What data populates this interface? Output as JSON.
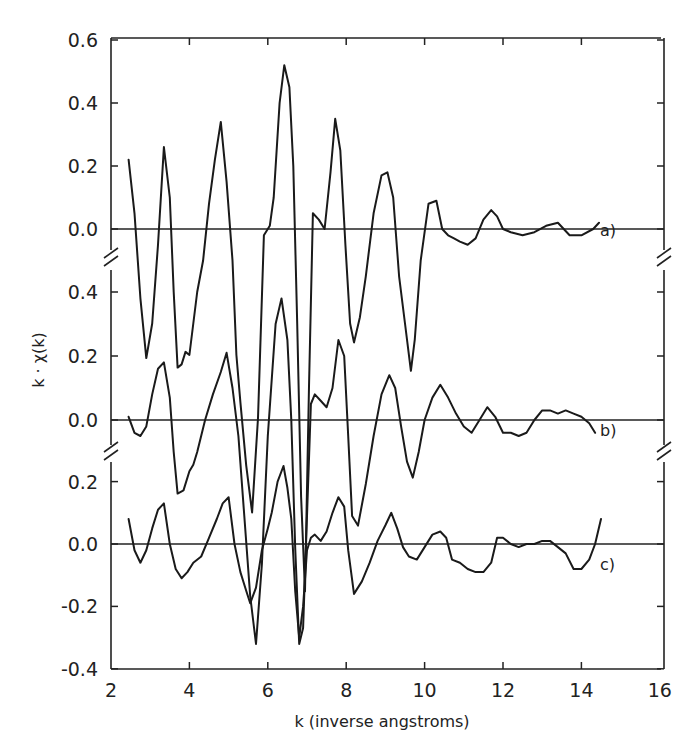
{
  "chart_data": {
    "type": "line",
    "title": "",
    "xlabel": "k (inverse angstroms)",
    "ylabel": "k · χ(k)",
    "xlim": [
      2,
      16
    ],
    "x_ticks": [
      "2",
      "4",
      "6",
      "8",
      "10",
      "12",
      "14",
      "16"
    ],
    "grid": false,
    "legend": null,
    "layout": "three vertically offset panels sharing one frame, separated by axis break marks",
    "panels": [
      {
        "name": "a)",
        "y_ticks": [
          "0.6",
          "0.4",
          "0.2",
          "0.0"
        ],
        "ylim": [
          -0.45,
          0.6
        ],
        "series": {
          "name": "a)",
          "x": [
            2.45,
            2.6,
            2.75,
            2.9,
            3.05,
            3.2,
            3.35,
            3.5,
            3.6,
            3.7,
            3.8,
            3.9,
            4.0,
            4.1,
            4.2,
            4.35,
            4.5,
            4.65,
            4.8,
            4.95,
            5.1,
            5.2,
            5.3,
            5.45,
            5.6,
            5.75,
            5.9,
            6.05,
            6.15,
            6.3,
            6.42,
            6.55,
            6.65,
            6.75,
            6.85,
            6.95,
            7.05,
            7.15,
            7.3,
            7.45,
            7.6,
            7.72,
            7.85,
            7.98,
            8.1,
            8.2,
            8.35,
            8.5,
            8.7,
            8.9,
            9.05,
            9.2,
            9.35,
            9.5,
            9.65,
            9.75,
            9.9,
            10.1,
            10.3,
            10.45,
            10.6,
            10.75,
            10.9,
            11.1,
            11.3,
            11.5,
            11.7,
            11.85,
            12.0,
            12.2,
            12.5,
            12.8,
            13.1,
            13.4,
            13.7,
            14.0,
            14.3,
            14.45
          ],
          "values": [
            0.22,
            0.05,
            -0.22,
            -0.41,
            -0.3,
            -0.05,
            0.26,
            0.1,
            -0.2,
            -0.44,
            -0.43,
            -0.39,
            -0.4,
            -0.3,
            -0.2,
            -0.1,
            0.08,
            0.22,
            0.34,
            0.15,
            -0.1,
            -0.4,
            -0.55,
            -0.75,
            -0.9,
            -0.6,
            -0.02,
            0.01,
            0.1,
            0.4,
            0.52,
            0.45,
            0.2,
            -0.3,
            -0.85,
            -1.15,
            -0.5,
            0.05,
            0.03,
            0.0,
            0.18,
            0.35,
            0.25,
            -0.05,
            -0.3,
            -0.36,
            -0.28,
            -0.15,
            0.05,
            0.17,
            0.18,
            0.1,
            -0.15,
            -0.3,
            -0.45,
            -0.35,
            -0.1,
            0.08,
            0.09,
            0.0,
            -0.02,
            -0.03,
            -0.04,
            -0.05,
            -0.03,
            0.03,
            0.06,
            0.04,
            0.0,
            -0.01,
            -0.02,
            -0.01,
            0.01,
            0.02,
            -0.02,
            -0.02,
            0.0,
            0.02
          ]
        }
      },
      {
        "name": "b)",
        "y_ticks": [
          "0.4",
          "0.2",
          "0.0"
        ],
        "ylim": [
          -0.1,
          0.45
        ],
        "series": {
          "name": "b)",
          "x": [
            2.45,
            2.6,
            2.75,
            2.9,
            3.05,
            3.2,
            3.35,
            3.5,
            3.6,
            3.7,
            3.85,
            4.0,
            4.1,
            4.2,
            4.4,
            4.6,
            4.8,
            4.95,
            5.1,
            5.25,
            5.4,
            5.55,
            5.7,
            5.85,
            6.0,
            6.2,
            6.35,
            6.5,
            6.6,
            6.7,
            6.8,
            6.9,
            7.0,
            7.1,
            7.2,
            7.35,
            7.5,
            7.65,
            7.8,
            7.95,
            8.05,
            8.15,
            8.3,
            8.5,
            8.7,
            8.9,
            9.1,
            9.25,
            9.4,
            9.55,
            9.7,
            9.85,
            10.0,
            10.2,
            10.4,
            10.6,
            10.8,
            11.0,
            11.2,
            11.4,
            11.6,
            11.8,
            12.0,
            12.2,
            12.4,
            12.6,
            12.8,
            13.0,
            13.2,
            13.4,
            13.6,
            13.8,
            14.0,
            14.2,
            14.35
          ],
          "values": [
            0.01,
            -0.04,
            -0.05,
            -0.02,
            0.08,
            0.16,
            0.18,
            0.07,
            -0.1,
            -0.23,
            -0.22,
            -0.16,
            -0.14,
            -0.1,
            0.0,
            0.08,
            0.15,
            0.21,
            0.1,
            -0.05,
            -0.3,
            -0.55,
            -0.7,
            -0.45,
            -0.05,
            0.3,
            0.38,
            0.25,
            0.0,
            -0.4,
            -0.7,
            -0.65,
            -0.3,
            0.05,
            0.08,
            0.06,
            0.04,
            0.1,
            0.25,
            0.2,
            -0.05,
            -0.3,
            -0.33,
            -0.2,
            -0.05,
            0.08,
            0.14,
            0.1,
            -0.02,
            -0.13,
            -0.18,
            -0.1,
            0.0,
            0.07,
            0.11,
            0.07,
            0.02,
            -0.02,
            -0.04,
            0.0,
            0.04,
            0.01,
            -0.04,
            -0.04,
            -0.05,
            -0.04,
            0.0,
            0.03,
            0.03,
            0.02,
            0.03,
            0.02,
            0.01,
            -0.01,
            -0.04
          ]
        }
      },
      {
        "name": "c)",
        "y_ticks": [
          "0.2",
          "0.0",
          "-0.2",
          "-0.4"
        ],
        "ylim": [
          -0.4,
          0.25
        ],
        "series": {
          "name": "c)",
          "x": [
            2.45,
            2.6,
            2.75,
            2.9,
            3.05,
            3.2,
            3.35,
            3.5,
            3.65,
            3.8,
            3.95,
            4.1,
            4.3,
            4.5,
            4.7,
            4.85,
            5.0,
            5.15,
            5.3,
            5.45,
            5.55,
            5.7,
            5.85,
            6.0,
            6.1,
            6.25,
            6.4,
            6.5,
            6.6,
            6.7,
            6.8,
            6.9,
            7.0,
            7.1,
            7.2,
            7.35,
            7.5,
            7.65,
            7.8,
            7.95,
            8.05,
            8.2,
            8.4,
            8.6,
            8.8,
            9.0,
            9.15,
            9.3,
            9.45,
            9.6,
            9.8,
            10.0,
            10.2,
            10.4,
            10.55,
            10.7,
            10.9,
            11.1,
            11.3,
            11.5,
            11.7,
            11.85,
            12.0,
            12.2,
            12.4,
            12.6,
            12.8,
            13.0,
            13.2,
            13.4,
            13.6,
            13.8,
            14.0,
            14.2,
            14.35,
            14.5
          ],
          "values": [
            0.08,
            -0.02,
            -0.06,
            -0.02,
            0.05,
            0.11,
            0.13,
            0.0,
            -0.08,
            -0.11,
            -0.09,
            -0.06,
            -0.04,
            0.02,
            0.08,
            0.13,
            0.15,
            0.0,
            -0.09,
            -0.15,
            -0.19,
            -0.14,
            -0.02,
            0.05,
            0.1,
            0.2,
            0.25,
            0.18,
            0.08,
            -0.15,
            -0.3,
            -0.2,
            -0.02,
            0.02,
            0.03,
            0.01,
            0.04,
            0.1,
            0.15,
            0.12,
            -0.02,
            -0.16,
            -0.12,
            -0.06,
            0.01,
            0.06,
            0.1,
            0.05,
            -0.01,
            -0.04,
            -0.05,
            -0.01,
            0.03,
            0.04,
            0.02,
            -0.05,
            -0.06,
            -0.08,
            -0.09,
            -0.09,
            -0.06,
            0.02,
            0.02,
            0.0,
            -0.01,
            0.0,
            0.0,
            0.01,
            0.01,
            -0.01,
            -0.03,
            -0.08,
            -0.08,
            -0.05,
            0.0,
            0.08
          ]
        }
      }
    ]
  }
}
